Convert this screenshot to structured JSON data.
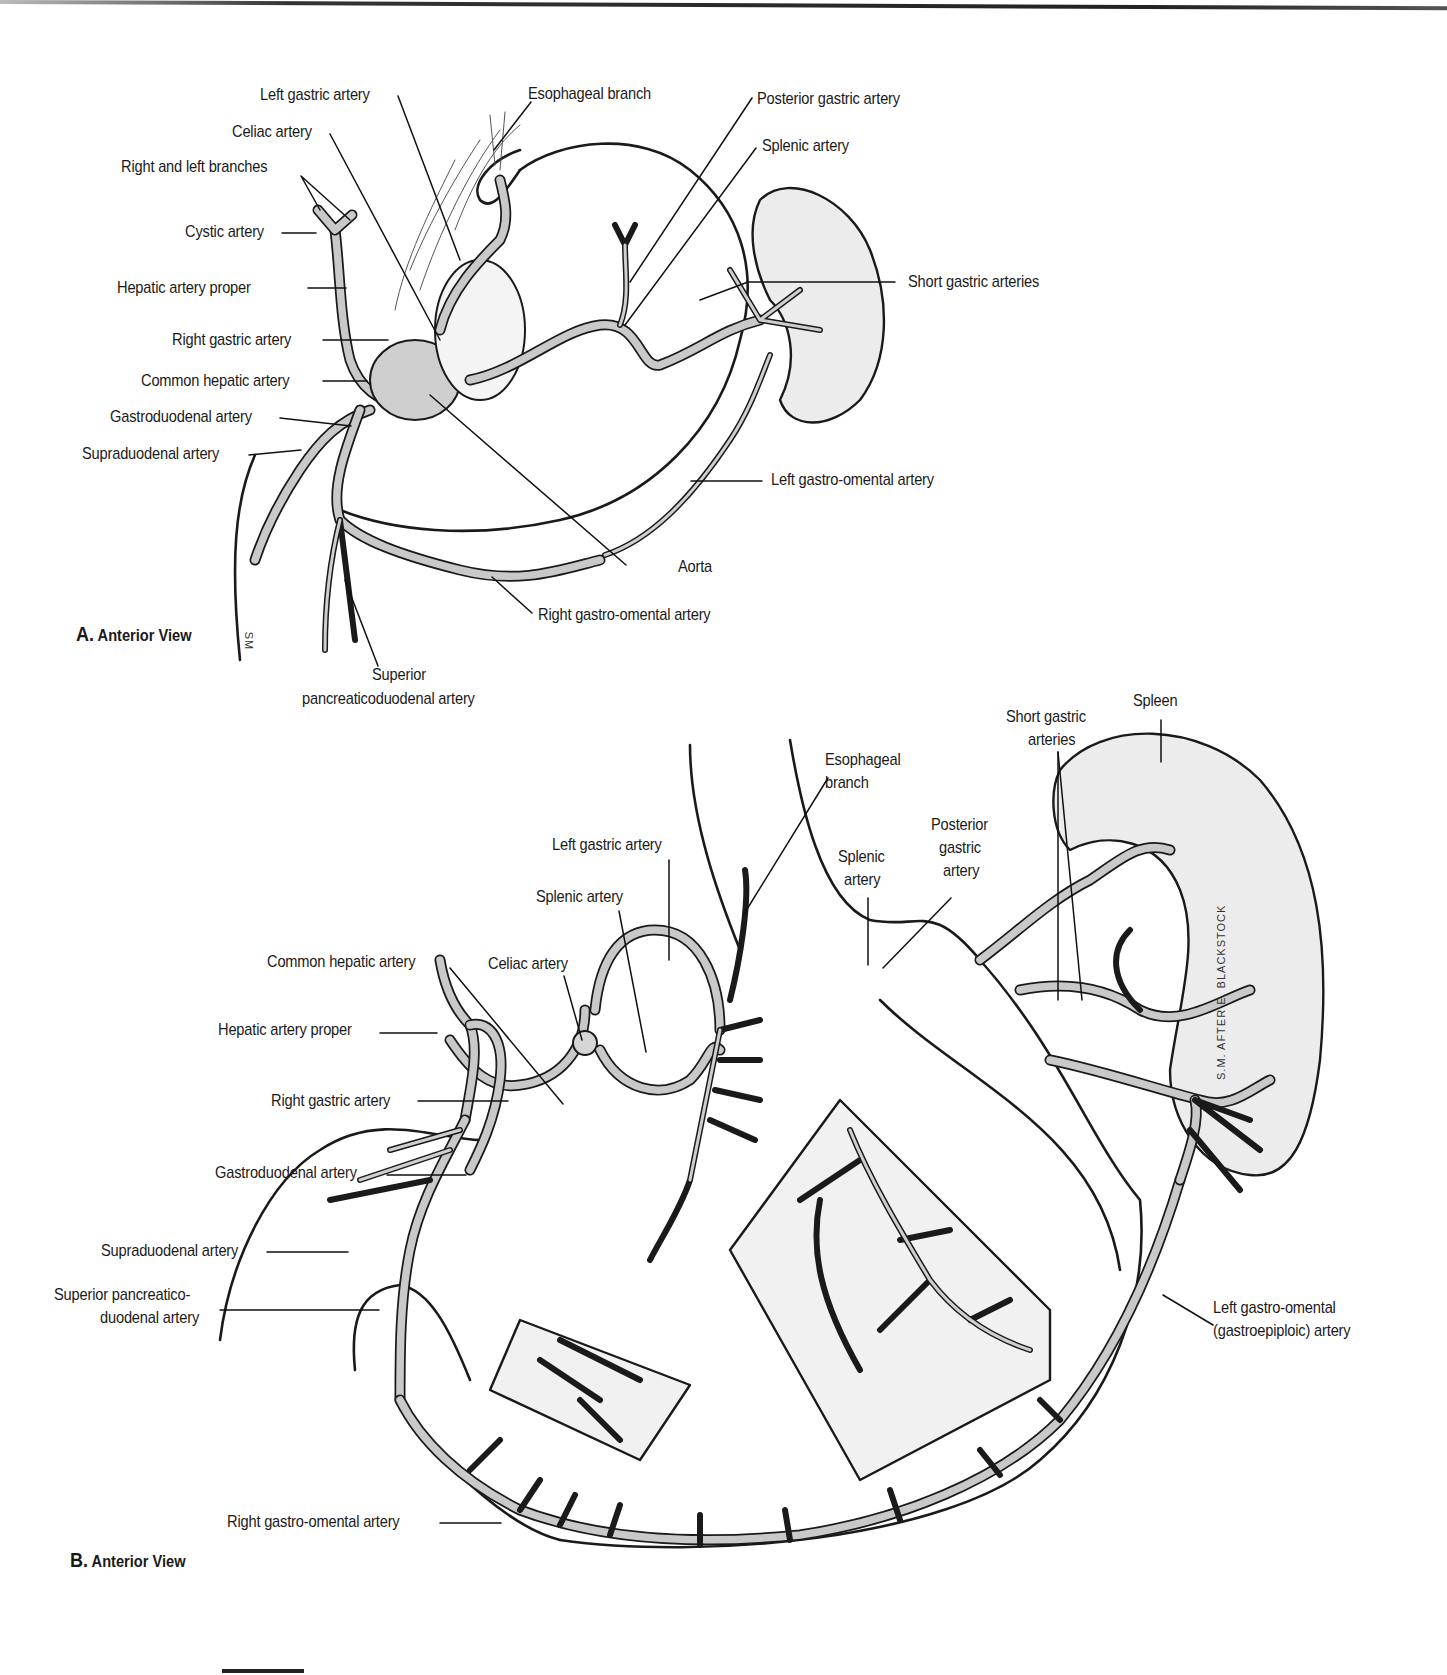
{
  "figure": {
    "panels": [
      {
        "id": "A",
        "letter": "A.",
        "title": "Anterior View",
        "labels": [
          {
            "text": "Left gastric artery"
          },
          {
            "text": "Esophageal branch"
          },
          {
            "text": "Posterior gastric artery"
          },
          {
            "text": "Celiac artery"
          },
          {
            "text": "Splenic artery"
          },
          {
            "text": "Right and left branches"
          },
          {
            "text": "Cystic artery"
          },
          {
            "text": "Short gastric arteries"
          },
          {
            "text": "Hepatic artery proper"
          },
          {
            "text": "Right gastric artery"
          },
          {
            "text": "Common hepatic artery"
          },
          {
            "text": "Gastroduodenal artery"
          },
          {
            "text": "Supraduodenal artery"
          },
          {
            "text": "Left gastro-omental artery"
          },
          {
            "text": "Aorta"
          },
          {
            "text": "Right gastro-omental artery"
          },
          {
            "text": "Superior"
          },
          {
            "text": "pancreaticoduodenal artery"
          }
        ],
        "signature": "SM"
      },
      {
        "id": "B",
        "letter": "B.",
        "title": "Anterior View",
        "labels": [
          {
            "text": "Spleen"
          },
          {
            "text": "Short gastric"
          },
          {
            "text": "arteries"
          },
          {
            "text": "Esophageal"
          },
          {
            "text": "branch"
          },
          {
            "text": "Posterior"
          },
          {
            "text": "gastric"
          },
          {
            "text": "artery"
          },
          {
            "text": "Left gastric artery"
          },
          {
            "text": "Splenic"
          },
          {
            "text": "artery"
          },
          {
            "text": "Splenic artery"
          },
          {
            "text": "Common hepatic artery"
          },
          {
            "text": "Celiac artery"
          },
          {
            "text": "Hepatic artery proper"
          },
          {
            "text": "Right gastric artery"
          },
          {
            "text": "Gastroduodenal artery"
          },
          {
            "text": "Supraduodenal artery"
          },
          {
            "text": "Superior pancreatico-"
          },
          {
            "text": "duodenal artery"
          },
          {
            "text": "Left gastro-omental"
          },
          {
            "text": "(gastroepiploic) artery"
          },
          {
            "text": "Right gastro-omental artery"
          }
        ],
        "signature": "S.M. AFTER E. BLACKSTOCK"
      }
    ],
    "colors": {
      "line": "#1a1a1a",
      "artery_fill": "#c9c9c9",
      "organ_fill": "#eeeeee",
      "background": "#ffffff"
    }
  }
}
